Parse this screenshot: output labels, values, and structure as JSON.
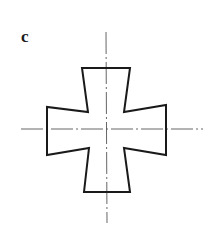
{
  "figure": {
    "label": "c",
    "colors": {
      "stroke": "#1a1a1a",
      "centerline": "#555555",
      "background": "#ffffff"
    },
    "outline_points": "82,68 130,68 124,112 166,105 166,155 124,148 130,192 84,192 89,148 47,155 47,107 88,112",
    "centerlines": {
      "vertical": {
        "x1": 106,
        "y1": 32,
        "x2": 107,
        "y2": 223
      },
      "horizontal": {
        "x1": 21,
        "y1": 129,
        "x2": 203,
        "y2": 129
      }
    }
  }
}
